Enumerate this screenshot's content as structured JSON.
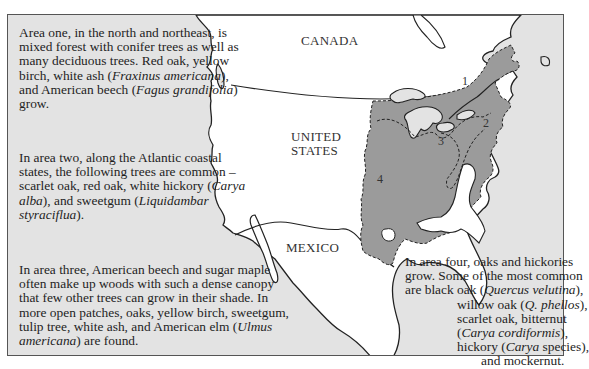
{
  "map": {
    "labels": {
      "canada": "CANADA",
      "united_states_line1": "UNITED",
      "united_states_line2": "STATES",
      "mexico": "MEXICO"
    },
    "area_numbers": [
      "1",
      "2",
      "3",
      "4"
    ],
    "colors": {
      "ocean": "#e3e3e3",
      "land": "#ffffff",
      "forest_region": "#9b9b9b",
      "lakes": "#e3e3e3",
      "outline": "#222222"
    }
  },
  "descriptions": {
    "area_one": {
      "t1": "Area one, in the north and northeast, is mixed forest with conifer trees as well as many deciduous trees. Red oak, yellow birch, white ash (",
      "i1": "Fraxinus americana",
      "t2": "), and American beech (",
      "i2": "Fagus grandifolia",
      "t3": ") grow."
    },
    "area_two": {
      "t1": "In area two, along the Atlantic coastal states, the following trees are common – scarlet oak, red oak, white hickory (",
      "i1": "Carya alba",
      "t2": "), and sweetgum (",
      "i2": "Liquidambar styraciflua",
      "t3": ")."
    },
    "area_three": {
      "t1": "In area three, American beech and sugar maple often make up woods with such a dense canopy that few other trees can grow in their shade. In more open patches, oaks, yellow birch, sweetgum, tulip tree, white ash, and American elm (",
      "i1": "Ulmus americana",
      "t2": ") are found."
    },
    "area_four": {
      "l1": "In area four, oaks and hickories",
      "l2": "grow. Some of the most common",
      "l3a": "are black oak (",
      "l3i": "Quercus velutina",
      "l3b": "),",
      "l4a": "willow oak (",
      "l4i": "Q. phellos",
      "l4b": "),",
      "l5": "scarlet oak, bitternut",
      "l6a": "(",
      "l6i": "Carya cordiformis",
      "l6b": "),",
      "l7a": "hickory (",
      "l7i": "Carya",
      "l7b": " species),",
      "l8": "and mockernut."
    }
  }
}
